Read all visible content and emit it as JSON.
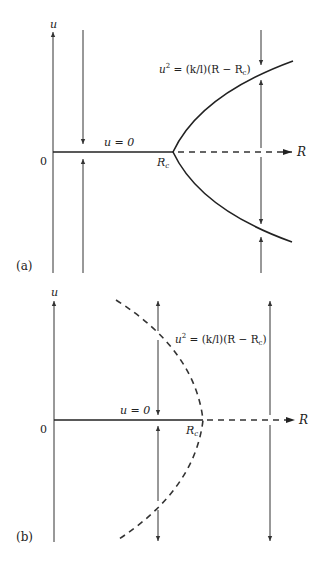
{
  "figure": {
    "panels": [
      {
        "id": "a",
        "panel_label": "(a)",
        "y_axis_label": "u",
        "x_axis_label": "R",
        "origin_label": "0",
        "trivial_branch_label": "u = 0",
        "critical_point_label": "R",
        "critical_point_sub": "c",
        "branch_equation": {
          "lhs": "u",
          "sup": "2",
          "rhs": " = (k/l)(R − R",
          "sub": "c",
          "close": ")"
        },
        "description": "Supercritical pitchfork bifurcation: u=0 stable for R<Rc (solid), unstable for R>Rc (dashed); parabolic branches stable (solid)"
      },
      {
        "id": "b",
        "panel_label": "(b)",
        "y_axis_label": "u",
        "x_axis_label": "R",
        "origin_label": "0",
        "trivial_branch_label": "u = 0",
        "critical_point_label": "R",
        "critical_point_sub": "c",
        "branch_equation": {
          "lhs": "u",
          "sup": "2",
          "rhs": " = (k/l)(R − R",
          "sub": "c",
          "close": ")"
        },
        "description": "Subcritical pitchfork bifurcation: u=0 stable for R<Rc (solid), unstable for R>Rc (dashed); parabolic branches unstable (dashed)"
      }
    ]
  }
}
